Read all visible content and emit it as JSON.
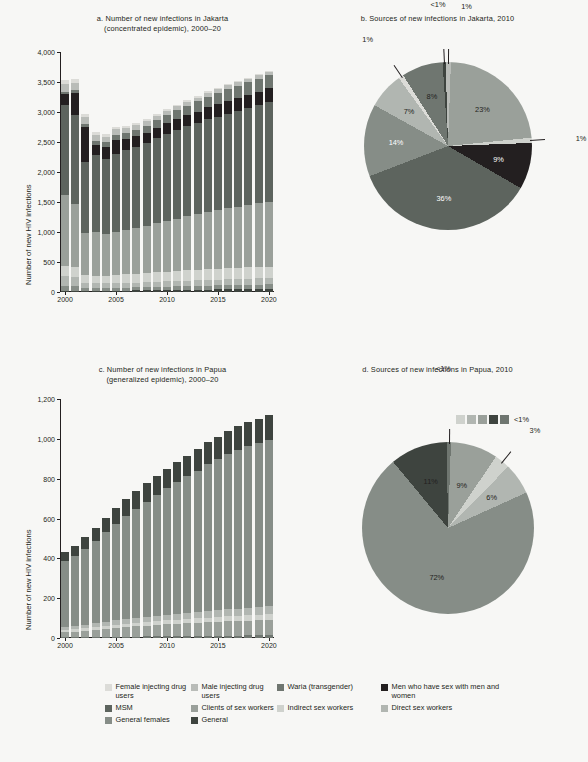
{
  "colors": {
    "female_idu": "#dcdcd8",
    "male_idu": "#b9bcb8",
    "waria": "#6f7670",
    "msmw": "#231f20",
    "msm": "#5d645e",
    "clients": "#9aa09a",
    "indirect_sw": "#cfd2cd",
    "direct_sw": "#b1b6b1",
    "general_females": "#868d87",
    "general": "#3e443f",
    "axis": "#231f20",
    "background": "#f7f7f5"
  },
  "legend": {
    "rows": [
      [
        {
          "label": "Female injecting drug users",
          "color_key": "female_idu",
          "name": "female-injecting-drug-users"
        },
        {
          "label": "Male injecting drug users",
          "color_key": "male_idu",
          "name": "male-injecting-drug-users"
        },
        {
          "label": "Waria (transgender)",
          "color_key": "waria",
          "name": "waria-transgender"
        },
        {
          "label": "Men who have sex with men and women",
          "color_key": "msmw",
          "name": "men-who-have-sex-with-men-and-women"
        }
      ],
      [
        {
          "label": "MSM",
          "color_key": "msm",
          "name": "msm"
        },
        {
          "label": "Clients of sex workers",
          "color_key": "clients",
          "name": "clients-of-sex-workers"
        },
        {
          "label": "Indirect sex workers",
          "color_key": "indirect_sw",
          "name": "indirect-sex-workers"
        },
        {
          "label": "Direct sex workers",
          "color_key": "direct_sw",
          "name": "direct-sex-workers"
        }
      ],
      [
        {
          "label": "General females",
          "color_key": "general_females",
          "name": "general-females"
        },
        {
          "label": "General",
          "color_key": "general",
          "name": "general"
        }
      ]
    ]
  },
  "chart_data": [
    {
      "id": "a",
      "type": "bar",
      "stacked": true,
      "title": "a. Number of new infections in Jakarta (concentrated epidemic), 2000–20",
      "title_line1": "a. Number of new infections in Jakarta",
      "title_line2": "(concentrated epidemic), 2000–20",
      "xlabel": "",
      "ylabel": "Number of new HIV infections",
      "ylim": [
        0,
        4000
      ],
      "yticks": [
        0,
        500,
        1000,
        1500,
        2000,
        2500,
        3000,
        3500,
        4000
      ],
      "yticklabels": [
        "0",
        "500",
        "1,000",
        "1,500",
        "2,000",
        "2,500",
        "3,000",
        "3,500",
        "4,000"
      ],
      "categories": [
        2000,
        2001,
        2002,
        2003,
        2004,
        2005,
        2006,
        2007,
        2008,
        2009,
        2010,
        2011,
        2012,
        2013,
        2014,
        2015,
        2016,
        2017,
        2018,
        2019,
        2020
      ],
      "xticklabels": [
        "2000",
        "2005",
        "2010",
        "2015",
        "2020"
      ],
      "grid": false,
      "legend_position": "bottom-shared",
      "series": [
        {
          "name": "Female injecting drug users",
          "color_key": "female_idu",
          "values": [
            70,
            60,
            55,
            50,
            45,
            40,
            38,
            36,
            34,
            32,
            30,
            28,
            26,
            25,
            24,
            23,
            22,
            21,
            20,
            20,
            20
          ]
        },
        {
          "name": "Male injecting drug users",
          "color_key": "male_idu",
          "values": [
            130,
            120,
            110,
            100,
            95,
            90,
            85,
            80,
            78,
            75,
            72,
            70,
            68,
            66,
            64,
            62,
            60,
            58,
            56,
            55,
            55
          ]
        },
        {
          "name": "Waria (transgender)",
          "color_key": "waria",
          "values": [
            40,
            50,
            60,
            70,
            80,
            90,
            100,
            110,
            120,
            130,
            140,
            150,
            160,
            170,
            180,
            190,
            200,
            205,
            210,
            215,
            220
          ]
        },
        {
          "name": "Men who have sex with men and women",
          "color_key": "msmw",
          "values": [
            190,
            360,
            580,
            160,
            190,
            230,
            180,
            175,
            170,
            170,
            175,
            180,
            185,
            190,
            200,
            205,
            210,
            215,
            220,
            225,
            230
          ]
        },
        {
          "name": "MSM",
          "color_key": "msm",
          "values": [
            1500,
            1480,
            1180,
            1280,
            1250,
            1300,
            1330,
            1360,
            1380,
            1420,
            1450,
            1480,
            1500,
            1520,
            1540,
            1560,
            1580,
            1600,
            1620,
            1640,
            1660
          ]
        },
        {
          "name": "Clients of sex workers",
          "color_key": "clients",
          "values": [
            1170,
            1060,
            700,
            730,
            700,
            720,
            740,
            760,
            790,
            820,
            850,
            870,
            900,
            930,
            960,
            980,
            1000,
            1020,
            1040,
            1060,
            1080
          ]
        },
        {
          "name": "Indirect sex workers",
          "color_key": "indirect_sw",
          "values": [
            180,
            170,
            130,
            130,
            130,
            135,
            140,
            145,
            150,
            155,
            160,
            165,
            170,
            172,
            175,
            178,
            180,
            182,
            184,
            186,
            188
          ]
        },
        {
          "name": "Direct sex workers",
          "color_key": "direct_sw",
          "values": [
            160,
            150,
            90,
            80,
            78,
            78,
            80,
            82,
            84,
            86,
            88,
            90,
            92,
            94,
            96,
            98,
            100,
            102,
            104,
            106,
            108
          ]
        },
        {
          "name": "General females",
          "color_key": "general_females",
          "values": [
            80,
            75,
            45,
            45,
            45,
            47,
            49,
            51,
            53,
            55,
            57,
            59,
            61,
            63,
            65,
            67,
            69,
            71,
            73,
            75,
            77
          ]
        },
        {
          "name": "General",
          "color_key": "general",
          "values": [
            20,
            20,
            20,
            20,
            20,
            22,
            24,
            26,
            28,
            30,
            32,
            34,
            36,
            38,
            40,
            42,
            44,
            46,
            48,
            50,
            52
          ]
        }
      ]
    },
    {
      "id": "b",
      "type": "pie",
      "title": "b. Sources of new infections in Jakarta, 2010",
      "slices": [
        {
          "label": "23%",
          "value": 23,
          "color_key": "clients",
          "inside": true
        },
        {
          "label": "1%",
          "value": 1,
          "color_key": "indirect_sw",
          "inside": false
        },
        {
          "label": "9%",
          "value": 9,
          "color_key": "msmw",
          "inside": true
        },
        {
          "label": "36%",
          "value": 36,
          "color_key": "msm",
          "inside": true
        },
        {
          "label": "14%",
          "value": 14,
          "color_key": "general_females",
          "inside": true
        },
        {
          "label": "7%",
          "value": 7,
          "color_key": "direct_sw",
          "inside": true
        },
        {
          "label": "1%",
          "value": 1,
          "color_key": "female_idu",
          "inside": false
        },
        {
          "label": "8%",
          "value": 8,
          "color_key": "waria",
          "inside": true
        },
        {
          "label": "<1%",
          "value": 0.6,
          "color_key": "general",
          "inside": false
        },
        {
          "label": "1%",
          "value": 1,
          "color_key": "male_idu",
          "inside": false
        }
      ]
    },
    {
      "id": "c",
      "type": "bar",
      "stacked": true,
      "title": "c. Number of new infections in Papua (generalized epidemic), 2000–20",
      "title_line1": "c. Number of new infections in Papua",
      "title_line2": "(generalized epidemic), 2000–20",
      "xlabel": "",
      "ylabel": "Number of new HIV infections",
      "ylim": [
        0,
        1200
      ],
      "yticks": [
        0,
        200,
        400,
        600,
        800,
        1000,
        1200
      ],
      "yticklabels": [
        "0",
        "200",
        "400",
        "600",
        "800",
        "1,000",
        "1,200"
      ],
      "categories": [
        2000,
        2001,
        2002,
        2003,
        2004,
        2005,
        2006,
        2007,
        2008,
        2009,
        2010,
        2011,
        2012,
        2013,
        2014,
        2015,
        2016,
        2017,
        2018,
        2019,
        2020
      ],
      "xticklabels": [
        "2000",
        "2005",
        "2010",
        "2015",
        "2020"
      ],
      "grid": false,
      "legend_position": "bottom-shared",
      "series": [
        {
          "name": "General",
          "color_key": "general",
          "values": [
            48,
            52,
            60,
            66,
            72,
            78,
            84,
            88,
            92,
            95,
            98,
            100,
            103,
            106,
            110,
            113,
            116,
            118,
            120,
            122,
            124
          ]
        },
        {
          "name": "General females",
          "color_key": "general_females",
          "values": [
            332,
            352,
            382,
            412,
            448,
            486,
            518,
            548,
            578,
            606,
            634,
            660,
            686,
            710,
            736,
            758,
            780,
            798,
            812,
            824,
            836
          ]
        },
        {
          "name": "Direct sex workers",
          "color_key": "direct_sw",
          "values": [
            14,
            16,
            18,
            20,
            22,
            24,
            25,
            26,
            27,
            28,
            29,
            30,
            31,
            32,
            33,
            34,
            35,
            36,
            37,
            38,
            39
          ]
        },
        {
          "name": "Indirect sex workers",
          "color_key": "indirect_sw",
          "values": [
            10,
            11,
            12,
            13,
            14,
            15,
            16,
            17,
            18,
            19,
            20,
            21,
            22,
            23,
            24,
            25,
            26,
            27,
            28,
            29,
            30
          ]
        },
        {
          "name": "Clients of sex workers",
          "color_key": "clients",
          "values": [
            26,
            28,
            32,
            36,
            40,
            44,
            48,
            51,
            54,
            57,
            60,
            62,
            64,
            66,
            68,
            70,
            72,
            73,
            74,
            75,
            76
          ]
        },
        {
          "name": "Waria (transgender)",
          "color_key": "waria",
          "values": [
            4,
            4,
            5,
            5,
            6,
            6,
            7,
            7,
            8,
            8,
            9,
            9,
            10,
            10,
            11,
            11,
            12,
            12,
            13,
            13,
            14
          ]
        }
      ]
    },
    {
      "id": "d",
      "type": "pie",
      "title": "d. Sources of new infections in Papua, 2010",
      "mini_legend_label": "<1%",
      "mini_legend_colors": [
        "indirect_sw",
        "direct_sw",
        "clients",
        "general",
        "waria"
      ],
      "slices": [
        {
          "label": "9%",
          "value": 9,
          "color_key": "clients",
          "inside": true
        },
        {
          "label": "3%",
          "value": 3,
          "color_key": "indirect_sw",
          "inside": false
        },
        {
          "label": "6%",
          "value": 6,
          "color_key": "direct_sw",
          "inside": true
        },
        {
          "label": "72%",
          "value": 72,
          "color_key": "general_females",
          "inside": true
        },
        {
          "label": "11%",
          "value": 11,
          "color_key": "general",
          "inside": true
        },
        {
          "label": "<1%",
          "value": 0.8,
          "color_key": "waria",
          "inside": false
        }
      ]
    }
  ]
}
